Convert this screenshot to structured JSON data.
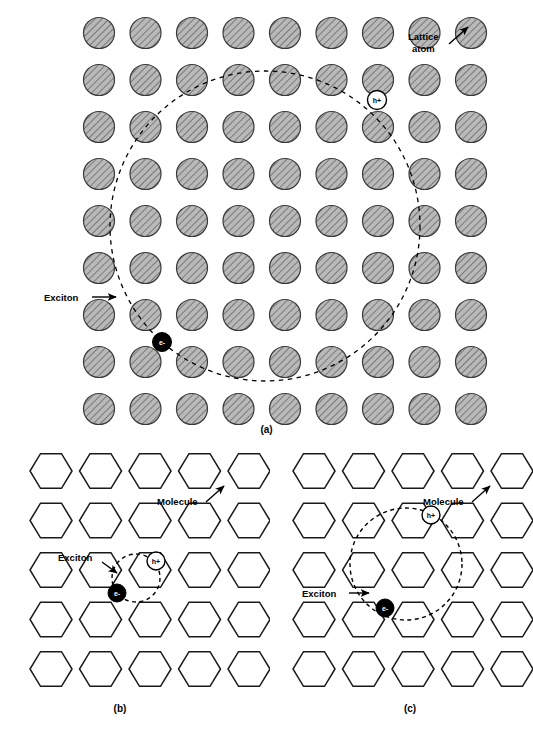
{
  "figure": {
    "panels": [
      {
        "id": "a",
        "caption": "(a)",
        "description": "Wannier-Mott exciton in an atomic lattice",
        "lattice": {
          "type": "atomic-circles",
          "rows": 9,
          "cols": 9,
          "x0": 99,
          "y0": 33,
          "dx": 46.5,
          "dy": 47.0,
          "radius": 15.5,
          "fill_color": "#b5b5b5",
          "stroke_color": "#3a3a3a"
        },
        "exciton_orbit": {
          "cx": 265,
          "cy": 226,
          "r": 155
        },
        "hole": {
          "cx": 377,
          "cy": 100,
          "label": "h+"
        },
        "electron": {
          "cx": 162,
          "cy": 342,
          "label": "e-"
        },
        "annotations": [
          {
            "name": "lattice-atom-label",
            "text_lines": [
              "Lattice",
              "atom"
            ],
            "x": 408,
            "y": 43,
            "arrow_from": [
              447,
              44
            ],
            "arrow_to": [
              468,
              27
            ]
          },
          {
            "name": "exciton-label",
            "text": "Exciton",
            "x": 44,
            "y": 301,
            "arrow_from": [
              90,
              297
            ],
            "arrow_to": [
              117,
              297
            ]
          }
        ]
      },
      {
        "id": "b",
        "caption": "(b)",
        "description": "Frenkel exciton localized on a single molecule",
        "lattice": {
          "type": "molecular-hexagons",
          "rows": 5,
          "cols": 5,
          "x0": 31,
          "y0": 33,
          "dx": 49.5,
          "dy": 49.5,
          "hex_radius": 21,
          "stroke_color": "#1a1a1a"
        },
        "exciton_orbit": {
          "cx": 116,
          "cy": 140,
          "r": 24
        },
        "hole": {
          "cx": 136,
          "cy": 123,
          "label": "h+"
        },
        "electron": {
          "cx": 97,
          "cy": 155,
          "label": "e-"
        },
        "annotations": [
          {
            "name": "molecule-label",
            "text": "Molecule",
            "x": 137,
            "y": 64,
            "arrow_from": [
              184,
              62
            ],
            "arrow_to": [
              203,
              47
            ]
          },
          {
            "name": "exciton-label",
            "text": "Exciton",
            "x": 40,
            "y": 120,
            "arrow_from": [
              82,
              122
            ],
            "arrow_to": [
              98,
              134
            ]
          }
        ]
      },
      {
        "id": "c",
        "caption": "(c)",
        "description": "Charge-transfer exciton spanning several molecules",
        "lattice": {
          "type": "molecular-hexagons",
          "rows": 5,
          "cols": 5,
          "x0": 31,
          "y0": 33,
          "dx": 49.5,
          "dy": 49.5,
          "hex_radius": 21,
          "stroke_color": "#1a1a1a"
        },
        "exciton_orbit": {
          "cx": 123,
          "cy": 126,
          "r": 56
        },
        "hole": {
          "cx": 148,
          "cy": 77,
          "label": "h+"
        },
        "electron": {
          "cx": 102,
          "cy": 170,
          "label": "e-"
        },
        "annotations": [
          {
            "name": "molecule-label",
            "text": "Molecule",
            "x": 140,
            "y": 64,
            "arrow_from": [
              186,
              62
            ],
            "arrow_to": [
              205,
              47
            ]
          },
          {
            "name": "exciton-label",
            "text": "Exciton",
            "x": 21,
            "y": 156,
            "arrow_from": [
              65,
              153
            ],
            "arrow_to": [
              86,
              153
            ]
          }
        ]
      }
    ],
    "colors": {
      "atom_fill": "#b5b5b5",
      "atom_stroke": "#3a3a3a",
      "hatch": "#555555",
      "molecule_stroke": "#1a1a1a",
      "electron_fill": "#000000",
      "electron_text": "#ffffff",
      "hole_fill": "#ffffff",
      "hole_text": "#000000",
      "dash_stroke": "#000000"
    }
  }
}
